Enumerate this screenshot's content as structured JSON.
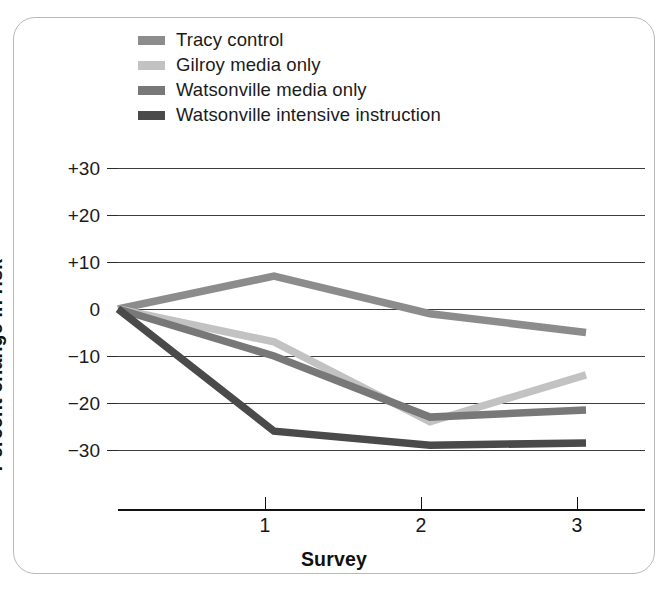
{
  "chart_data": {
    "type": "line",
    "title": "",
    "subtitle": "",
    "xlabel": "Survey",
    "ylabel": "Percent change in risk",
    "x": [
      0,
      1,
      2,
      3
    ],
    "xtick_labels": [
      "",
      "1",
      "2",
      "3"
    ],
    "ytick_labels": [
      "+30",
      "+20",
      "+10",
      "0",
      "−10",
      "−20",
      "−30"
    ],
    "ytick_values": [
      30,
      20,
      10,
      0,
      -10,
      -20,
      -30
    ],
    "ylim": [
      -35,
      32
    ],
    "xlim": [
      0,
      3.35
    ],
    "grid": "horizontal",
    "legend_position": "top-left",
    "series": [
      {
        "name": "Tracy control",
        "color": "#8c8c8c",
        "values": [
          0,
          7,
          -1,
          -5
        ]
      },
      {
        "name": "Gilroy media only",
        "color": "#c2c2c2",
        "values": [
          0,
          -7,
          -24,
          -14
        ]
      },
      {
        "name": "Watsonville media only",
        "color": "#787878",
        "values": [
          0,
          -10,
          -23,
          -21.5
        ]
      },
      {
        "name": "Watsonville intensive instruction",
        "color": "#4a4a4a",
        "values": [
          0,
          -26,
          -29,
          -28.5
        ]
      }
    ]
  },
  "legend": {
    "items": [
      {
        "label": "Tracy control",
        "swatch_color": "#8c8c8c",
        "icon": "line-swatch-icon"
      },
      {
        "label": "Gilroy media only",
        "swatch_color": "#c2c2c2",
        "icon": "line-swatch-icon"
      },
      {
        "label": "Watsonville media only",
        "swatch_color": "#787878",
        "icon": "line-swatch-icon"
      },
      {
        "label": "Watsonville intensive instruction",
        "swatch_color": "#4a4a4a",
        "icon": "line-swatch-icon"
      }
    ]
  },
  "axes": {
    "y_title": "Percent change in risk",
    "x_title": "Survey",
    "y_labels": [
      "+30",
      "+20",
      "+10",
      "0",
      "−10",
      "−20",
      "−30"
    ],
    "x_labels": [
      "1",
      "2",
      "3"
    ]
  },
  "style": {
    "frame_border_color": "#b9b9b9",
    "gridline_color": "#3d3d3d",
    "axis_color": "#111111",
    "text_color": "#1b1b1b",
    "background": "#ffffff"
  }
}
